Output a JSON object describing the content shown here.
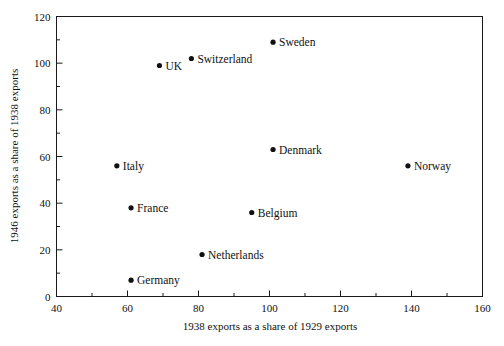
{
  "chart_data": {
    "type": "scatter",
    "title": "",
    "xlabel": "1938 exports as a share of 1929 exports",
    "ylabel": "1946 exports as a share of 1938 exports",
    "xlim": [
      40,
      160
    ],
    "ylim": [
      0,
      120
    ],
    "x_major_ticks": [
      40,
      60,
      80,
      100,
      120,
      140,
      160
    ],
    "y_major_ticks": [
      0,
      20,
      40,
      60,
      80,
      100,
      120
    ],
    "x_minor_ticks": [
      50,
      70,
      90,
      110,
      130,
      150
    ],
    "y_minor_ticks": [
      10,
      30,
      50,
      70,
      90,
      110
    ],
    "x_tick_labels": [
      "40",
      "60",
      "80",
      "100",
      "120",
      "140",
      "160"
    ],
    "y_tick_labels": [
      "0",
      "20",
      "40",
      "60",
      "80",
      "100",
      "120"
    ],
    "grid": false,
    "legend": "none",
    "marker_color": "#111111",
    "points": [
      {
        "label": "Sweden",
        "x": 101,
        "y": 109,
        "label_pos": "right"
      },
      {
        "label": "Switzerland",
        "x": 78,
        "y": 102,
        "label_pos": "right"
      },
      {
        "label": "UK",
        "x": 69,
        "y": 99,
        "label_pos": "right"
      },
      {
        "label": "Denmark",
        "x": 101,
        "y": 63,
        "label_pos": "right"
      },
      {
        "label": "Norway",
        "x": 139,
        "y": 56,
        "label_pos": "right"
      },
      {
        "label": "Italy",
        "x": 57,
        "y": 56,
        "label_pos": "right"
      },
      {
        "label": "France",
        "x": 61,
        "y": 38,
        "label_pos": "right"
      },
      {
        "label": "Belgium",
        "x": 95,
        "y": 36,
        "label_pos": "right"
      },
      {
        "label": "Netherlands",
        "x": 81,
        "y": 18,
        "label_pos": "right"
      },
      {
        "label": "Germany",
        "x": 61,
        "y": 7,
        "label_pos": "right"
      }
    ]
  }
}
